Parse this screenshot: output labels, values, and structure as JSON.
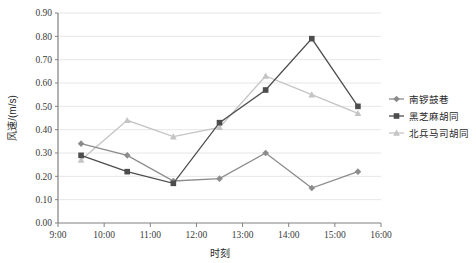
{
  "chart_data": {
    "type": "line",
    "title": "",
    "xlabel": "时刻",
    "ylabel": "风速/(m/s)",
    "x": [
      "9:30",
      "10:30",
      "11:30",
      "12:30",
      "13:30",
      "14:30",
      "15:30"
    ],
    "xlim": [
      9,
      16
    ],
    "ylim": [
      0.0,
      0.9
    ],
    "xticks": [
      "9:00",
      "10:00",
      "11:00",
      "12:00",
      "13:00",
      "14:00",
      "15:00",
      "16:00"
    ],
    "xtick_values": [
      9,
      10,
      11,
      12,
      13,
      14,
      15,
      16
    ],
    "yticks": [
      "0.00",
      "0.10",
      "0.20",
      "0.30",
      "0.40",
      "0.50",
      "0.60",
      "0.70",
      "0.80",
      "0.90"
    ],
    "ytick_values": [
      0.0,
      0.1,
      0.2,
      0.3,
      0.4,
      0.5,
      0.6,
      0.7,
      0.8,
      0.9
    ],
    "grid": true,
    "legend_position": "right",
    "series": [
      {
        "name": "南锣鼓巷",
        "color": "#8c8c8c",
        "marker": "diamond",
        "values": [
          0.34,
          0.29,
          0.18,
          0.19,
          0.3,
          0.15,
          0.22
        ]
      },
      {
        "name": "黑芝麻胡同",
        "color": "#4d4d4d",
        "marker": "square",
        "values": [
          0.29,
          0.22,
          0.17,
          0.43,
          0.57,
          0.79,
          0.5
        ]
      },
      {
        "name": "北兵马司胡同",
        "color": "#c4c4c4",
        "marker": "triangle",
        "values": [
          0.27,
          0.44,
          0.37,
          0.41,
          0.63,
          0.55,
          0.47
        ]
      }
    ]
  },
  "legend": {
    "items": [
      {
        "label": "南锣鼓巷"
      },
      {
        "label": "黑芝麻胡同"
      },
      {
        "label": "北兵马司胡同"
      }
    ]
  },
  "axes": {
    "x_title": "时刻",
    "y_title": "风速/(m/s)"
  }
}
